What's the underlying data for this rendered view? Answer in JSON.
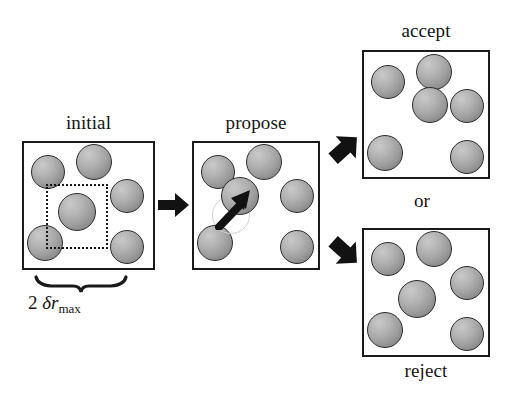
{
  "figure": {
    "background_color": "#ffffff",
    "particle_fill_light": "#c9c9c9",
    "particle_fill_dark": "#787878",
    "particle_stroke": "#2b2b2b",
    "ghost_stroke": "#d2d2d2",
    "line_color": "#1a1a1a"
  },
  "panels": {
    "initial": {
      "caption": "initial",
      "particles": [
        {
          "cx": 48,
          "cy": 172,
          "r": 17
        },
        {
          "cx": 94,
          "cy": 162,
          "r": 18
        },
        {
          "cx": 127,
          "cy": 196,
          "r": 17
        },
        {
          "cx": 77,
          "cy": 212,
          "r": 19
        },
        {
          "cx": 45,
          "cy": 243,
          "r": 18
        },
        {
          "cx": 127,
          "cy": 247,
          "r": 17
        }
      ],
      "dotted_region": {
        "x": 46,
        "y": 184,
        "w": 62,
        "h": 65
      },
      "measure_label_prefix": "2",
      "measure_label_symbol": "δr",
      "measure_label_subscript": "max"
    },
    "propose": {
      "caption": "propose",
      "particles": [
        {
          "cx": 218,
          "cy": 172,
          "r": 17
        },
        {
          "cx": 264,
          "cy": 162,
          "r": 18
        },
        {
          "cx": 297,
          "cy": 196,
          "r": 17
        },
        {
          "cx": 240,
          "cy": 196,
          "r": 19
        },
        {
          "cx": 215,
          "cy": 243,
          "r": 18
        },
        {
          "cx": 297,
          "cy": 247,
          "r": 17
        }
      ],
      "ghost_particle": {
        "cx": 231,
        "cy": 215,
        "r": 19
      },
      "move_arrow": {
        "x1": 227,
        "y1": 222,
        "x2": 246,
        "y2": 198
      }
    },
    "accept": {
      "caption": "accept",
      "particles": [
        {
          "cx": 388,
          "cy": 82,
          "r": 17
        },
        {
          "cx": 434,
          "cy": 72,
          "r": 18
        },
        {
          "cx": 467,
          "cy": 106,
          "r": 17
        },
        {
          "cx": 430,
          "cy": 105,
          "r": 18
        },
        {
          "cx": 385,
          "cy": 153,
          "r": 18
        },
        {
          "cx": 467,
          "cy": 157,
          "r": 17
        }
      ]
    },
    "reject": {
      "caption": "reject",
      "particles": [
        {
          "cx": 388,
          "cy": 259,
          "r": 17
        },
        {
          "cx": 434,
          "cy": 249,
          "r": 18
        },
        {
          "cx": 467,
          "cy": 283,
          "r": 17
        },
        {
          "cx": 417,
          "cy": 299,
          "r": 19
        },
        {
          "cx": 385,
          "cy": 330,
          "r": 18
        },
        {
          "cx": 467,
          "cy": 334,
          "r": 17
        }
      ]
    }
  },
  "connector": {
    "or_label": "or"
  }
}
